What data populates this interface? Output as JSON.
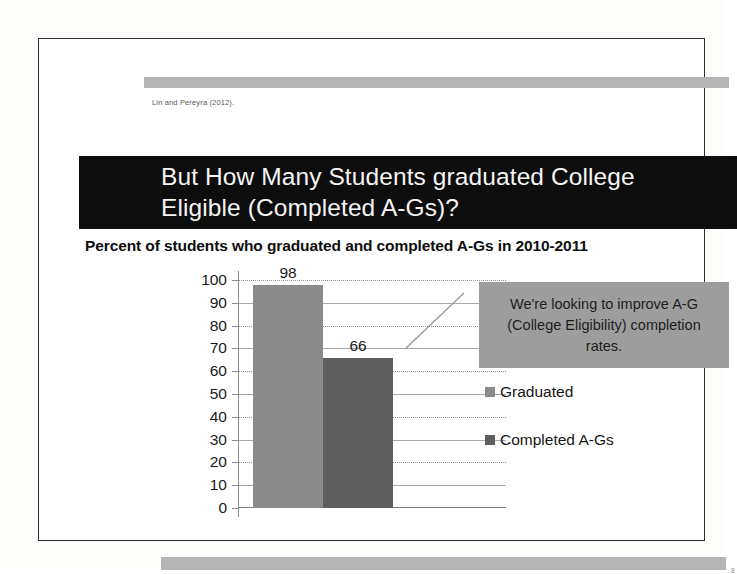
{
  "slide": {
    "citation": "Lin and Pereyra (2012).",
    "title": "But How Many Students graduated College Eligible (Completed A-Gs)?",
    "subtitle": "Percent of students who graduated and completed A-Gs in 2010-2011",
    "page_number": "8",
    "colors": {
      "title_banner_bg": "#0d0d0d",
      "title_text": "#f4f4f4",
      "band": "#b4b4b4",
      "callout_bg": "#9d9d9d",
      "slide_border": "#2b2b2b"
    }
  },
  "callout": {
    "text": "We're looking to improve A-G (College Eligibility) completion rates."
  },
  "chart_data": {
    "type": "bar",
    "title": "Percent of students who graduated and completed A-Gs in 2010-2011",
    "xlabel": "",
    "ylabel": "",
    "ylim": [
      0,
      100
    ],
    "yticks": [
      100,
      90,
      80,
      70,
      60,
      50,
      40,
      30,
      20,
      10,
      0
    ],
    "grid": true,
    "legend_position": "right",
    "categories": [
      "2010-2011"
    ],
    "series": [
      {
        "name": "Graduated",
        "values": [
          98
        ],
        "color": "#8a8a8a"
      },
      {
        "name": "Completed A-Gs",
        "values": [
          66
        ],
        "color": "#5e5e5e"
      }
    ],
    "data_labels": [
      "98",
      "66"
    ],
    "annotations": [
      {
        "text": "We're looking to improve A-G (College Eligibility) completion rates.",
        "leader_line": true
      }
    ]
  }
}
